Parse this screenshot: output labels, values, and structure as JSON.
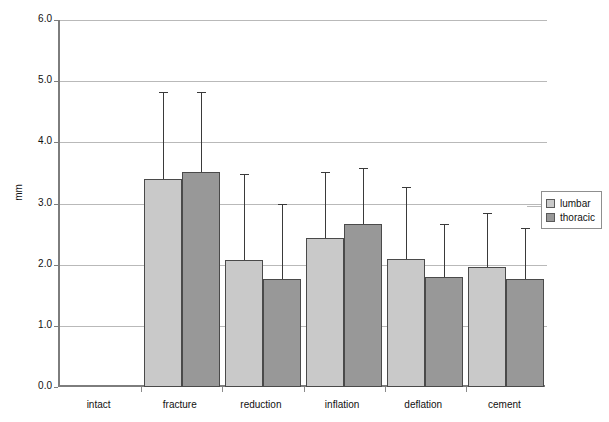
{
  "chart_data": {
    "type": "bar",
    "title": "",
    "xlabel": "",
    "ylabel": "mm",
    "ylim": [
      0.0,
      6.0
    ],
    "ytick_step": 1.0,
    "ytick_labels": [
      "0.0",
      "1.0",
      "2.0",
      "3.0",
      "4.0",
      "5.0",
      "6.0"
    ],
    "grid": true,
    "legend_position": "right",
    "categories": [
      "intact",
      "fracture",
      "reduction",
      "inflation",
      "deflation",
      "cement"
    ],
    "series": [
      {
        "name": "lumbar",
        "color": "#c9c9c9",
        "values": [
          0.0,
          3.4,
          2.07,
          2.44,
          2.1,
          1.96
        ],
        "errors_upper": [
          0.0,
          1.42,
          1.41,
          1.08,
          1.17,
          0.88
        ]
      },
      {
        "name": "thoracic",
        "color": "#989898",
        "values": [
          0.0,
          3.51,
          1.77,
          2.67,
          1.8,
          1.76
        ],
        "errors_upper": [
          0.0,
          1.31,
          1.23,
          0.91,
          0.87,
          0.84
        ]
      }
    ]
  },
  "axis": {
    "y_label": "mm",
    "y_ticks": [
      "6.0",
      "5.0",
      "4.0",
      "3.0",
      "2.0",
      "1.0",
      "0.0"
    ],
    "x_categories": [
      "intact",
      "fracture",
      "reduction",
      "inflation",
      "deflation",
      "cement"
    ]
  },
  "legend": {
    "items": [
      {
        "label": "lumbar",
        "color": "#c9c9c9"
      },
      {
        "label": "thoracic",
        "color": "#989898"
      }
    ]
  }
}
